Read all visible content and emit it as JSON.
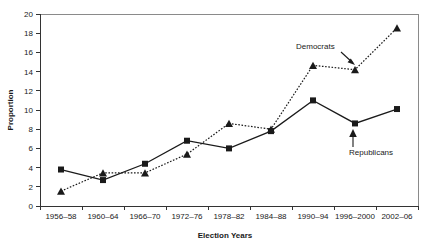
{
  "chart_data": {
    "type": "line",
    "title": "",
    "xlabel": "Election Years",
    "ylabel": "Proportion",
    "categories": [
      "1956–58",
      "1960–64",
      "1966–70",
      "1972–76",
      "1978–82",
      "1984–88",
      "1990–94",
      "1996–2000",
      "2002–06"
    ],
    "ylim": [
      0,
      20
    ],
    "yticks": [
      0,
      2,
      4,
      6,
      8,
      10,
      12,
      14,
      16,
      18,
      20
    ],
    "grid": false,
    "legend_position": "inline-annotations",
    "series": [
      {
        "name": "Republicans",
        "marker": "square",
        "line_style": "solid",
        "color": "#1a1a1a",
        "values": [
          3.8,
          2.7,
          4.4,
          6.8,
          6.0,
          7.8,
          11.0,
          8.6,
          10.1
        ]
      },
      {
        "name": "Democrats",
        "marker": "triangle",
        "line_style": "dotted",
        "color": "#1a1a1a",
        "values": [
          1.55,
          3.45,
          3.45,
          5.4,
          8.6,
          8.0,
          14.65,
          14.2,
          18.55
        ]
      }
    ],
    "annotations": [
      {
        "label": "Democrats",
        "target_series": "Democrats",
        "target_category": "1996–2000"
      },
      {
        "label": "Republicans",
        "target_series": "Republicans",
        "target_category": "1996–2000"
      }
    ]
  },
  "axis": {
    "y_tick_labels": [
      "20",
      "18",
      "16",
      "14",
      "12",
      "10",
      "8",
      "6",
      "4",
      "2",
      "0"
    ],
    "y_title": "Proportion",
    "x_title": "Election Years"
  }
}
